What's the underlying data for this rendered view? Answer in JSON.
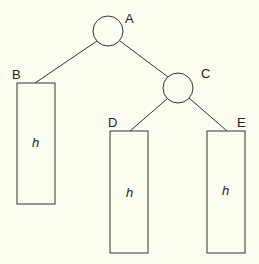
{
  "diagram": {
    "type": "binary-tree",
    "nodes": [
      {
        "id": "A",
        "label": "A",
        "kind": "internal"
      },
      {
        "id": "C",
        "label": "C",
        "kind": "internal"
      }
    ],
    "subtrees": [
      {
        "id": "B",
        "label": "B",
        "height_label": "h"
      },
      {
        "id": "D",
        "label": "D",
        "height_label": "h"
      },
      {
        "id": "E",
        "label": "E",
        "height_label": "h"
      }
    ],
    "edges": [
      {
        "from": "A",
        "to": "B"
      },
      {
        "from": "A",
        "to": "C"
      },
      {
        "from": "C",
        "to": "D"
      },
      {
        "from": "C",
        "to": "E"
      }
    ]
  }
}
